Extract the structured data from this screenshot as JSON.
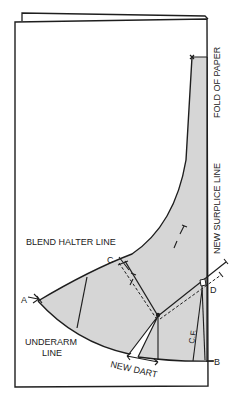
{
  "diagram": {
    "type": "sewing-pattern-draft",
    "colors": {
      "line": "#1e1e1e",
      "shade": "#d6d6d6",
      "paper": "#ffffff"
    },
    "labels": {
      "fold_of_paper": "FOLD OF PAPER",
      "new_surplice_line": "NEW SURPLICE LINE",
      "blend_halter_line": "BLEND HALTER LINE",
      "underarm_line_1": "UNDERARM",
      "underarm_line_2": "LINE",
      "new_dart": "NEW DART",
      "center_front": "C.F."
    },
    "points": {
      "a": "A",
      "b": "B",
      "c": "C",
      "d": "D"
    }
  }
}
